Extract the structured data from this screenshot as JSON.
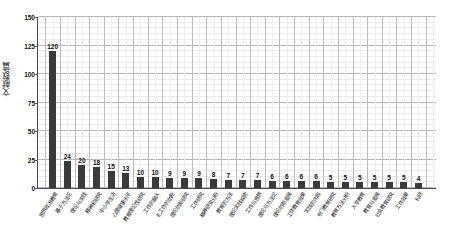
{
  "chart_data": {
    "type": "bar",
    "title": "",
    "subtitle": "",
    "xlabel": "",
    "ylabel": "文献数/篇",
    "ylim": [
      0,
      150
    ],
    "y_ticks": [
      0,
      25,
      50,
      75,
      100,
      125,
      150
    ],
    "grid": "major and minor gridlines, horizontal and vertical",
    "legend": "none",
    "bar_color": "#3a3a3a",
    "categories": [
      "思想政治教育",
      "基于方法论",
      "理论与实践",
      "精神和研究",
      "中小学生活",
      "心理健康水平",
      "教育理论性研究",
      "工作的融入",
      "礼工作的创新",
      "理论创新研究",
      "工作研究",
      "精神研究分析",
      "教育的方法",
      "理论实践探索",
      "工作与思想",
      "理论与方法论",
      "理论创新发展",
      "工作教育效果",
      "实践的内容",
      "专门教育研究",
      "教育方法分析",
      "入学教育",
      "教育与发展",
      "社会教育研究",
      "工作效果",
      "科研"
    ],
    "values": [
      120,
      24,
      20,
      18,
      15,
      13,
      10,
      10,
      9,
      9,
      9,
      8,
      7,
      7,
      7,
      6,
      6,
      6,
      6,
      5,
      5,
      5,
      5,
      5,
      5,
      4
    ]
  }
}
